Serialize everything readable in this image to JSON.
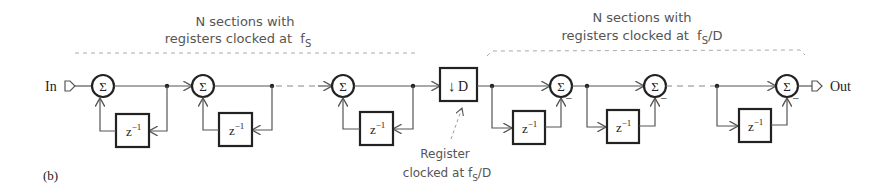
{
  "figure": {
    "label": "(b)",
    "input_label": "In",
    "output_label": "Out",
    "integrator_section": {
      "title_line1": "N sections with",
      "title_line2": "registers clocked at",
      "clock": "f",
      "clock_sub": "S",
      "clock_suffix": ""
    },
    "comb_section": {
      "title_line1": "N sections with",
      "title_line2": "registers clocked at",
      "clock": "f",
      "clock_sub": "S",
      "clock_suffix": "/D"
    },
    "decimator": {
      "symbol": "↓",
      "label": "D",
      "annotation_line1": "Register",
      "annotation_line2": "clocked at f",
      "annotation_sub": "S",
      "annotation_suffix": "/D"
    },
    "summer_symbol": "Σ",
    "delay_label": "z",
    "delay_exp": "−1",
    "minus_sign": "−"
  }
}
